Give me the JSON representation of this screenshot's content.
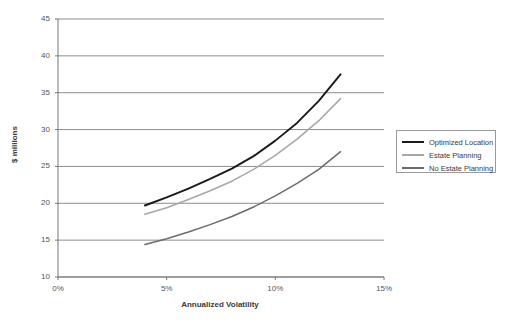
{
  "chart_data": {
    "type": "line",
    "title": "",
    "xlabel": "Annualized Volatility",
    "ylabel": "$ millions",
    "xlim": [
      0,
      15
    ],
    "ylim": [
      10,
      45
    ],
    "grid": "horizontal",
    "legend_position": "right",
    "x_tick_labels": [
      "0%",
      "5%",
      "10%",
      "15%"
    ],
    "x_tick_values": [
      0,
      5,
      10,
      15
    ],
    "y_tick_labels": [
      "10",
      "15",
      "20",
      "25",
      "30",
      "35",
      "40",
      "45"
    ],
    "y_tick_values": [
      10,
      15,
      20,
      25,
      30,
      35,
      40,
      45
    ],
    "x": [
      4,
      5,
      6,
      7,
      8,
      9,
      10,
      11,
      12,
      13
    ],
    "series": [
      {
        "name": "Optimized Location",
        "color": "#1a1a1a",
        "width": 1.9,
        "values": [
          19.7,
          20.8,
          22.0,
          23.3,
          24.7,
          26.4,
          28.5,
          30.9,
          33.9,
          37.5
        ]
      },
      {
        "name": "Estate Planning",
        "color": "#a8a8a8",
        "width": 1.6,
        "values": [
          18.5,
          19.4,
          20.5,
          21.7,
          23.0,
          24.6,
          26.5,
          28.7,
          31.2,
          34.2
        ]
      },
      {
        "name": "No Estate Planning",
        "color": "#6b6b6b",
        "width": 1.5,
        "values": [
          14.4,
          15.2,
          16.1,
          17.1,
          18.2,
          19.5,
          21.0,
          22.7,
          24.6,
          27.0
        ]
      }
    ]
  },
  "legend": {
    "items": [
      {
        "label": "Optimized Location"
      },
      {
        "label": "Estate Planning"
      },
      {
        "label": "No Estate Planning"
      }
    ]
  },
  "axes": {
    "x_title": "Annualized Volatility",
    "y_title": "$ millions"
  },
  "colors": {
    "optimized_location": "#1a1a1a",
    "estate_planning": "#a8a8a8",
    "no_estate_planning": "#6b6b6b",
    "gridline": "#808080",
    "axis": "#777777",
    "plot_background": "#ffffff"
  }
}
